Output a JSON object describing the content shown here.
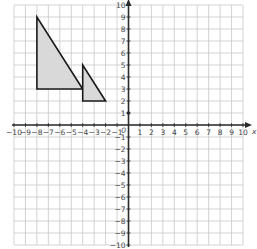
{
  "diagram": {
    "type": "coordinate-plane",
    "x_range": [
      -10,
      10
    ],
    "y_range": [
      -10,
      10
    ],
    "x_axis_label": "x",
    "y_axis_label": "y",
    "origin_label": "0",
    "x_ticks": [
      -10,
      -9,
      -8,
      -7,
      -6,
      -5,
      -4,
      -3,
      -2,
      -1,
      1,
      2,
      3,
      4,
      5,
      6,
      7,
      8,
      9,
      10
    ],
    "y_ticks": [
      10,
      9,
      8,
      7,
      6,
      5,
      4,
      3,
      2,
      1,
      -1,
      -2,
      -3,
      -4,
      -5,
      -6,
      -7,
      -8,
      -9,
      -10
    ],
    "colors": {
      "grid": "#c8c8c8",
      "axis": "#2a2a2a",
      "shape_fill": "#d9d9d9",
      "shape_stroke": "#1a1a1a"
    },
    "shapes": [
      {
        "name": "large-triangle",
        "vertices": [
          [
            -8,
            9
          ],
          [
            -8,
            3
          ],
          [
            -4,
            3
          ]
        ]
      },
      {
        "name": "small-triangle",
        "vertices": [
          [
            -4,
            5
          ],
          [
            -4,
            2
          ],
          [
            -2,
            2
          ]
        ]
      }
    ],
    "points": [
      {
        "name": "marker-point",
        "coords": [
          0,
          1
        ]
      }
    ]
  }
}
